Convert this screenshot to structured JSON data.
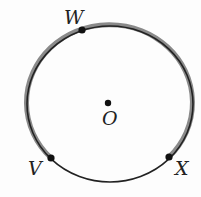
{
  "diagram": {
    "type": "circle",
    "center": {
      "label": "O"
    },
    "points": [
      {
        "label": "W"
      },
      {
        "label": "V"
      },
      {
        "label": "X"
      }
    ],
    "highlighted_arc": "VWX",
    "colors": {
      "circle": "#222222",
      "highlight": "#888888",
      "background": "#fdfdfd"
    }
  }
}
